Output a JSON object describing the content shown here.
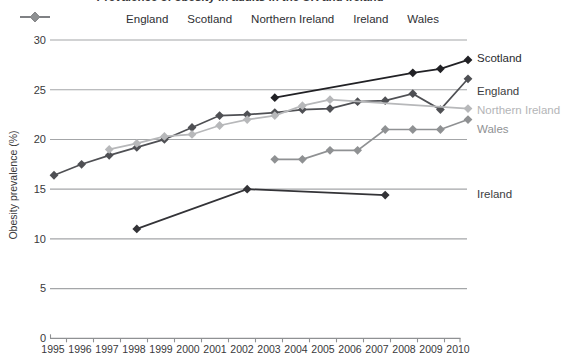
{
  "chart_data": {
    "type": "line",
    "title": "Prevalence of obesity in adults in the UK and Ireland",
    "xlabel": "",
    "ylabel": "Obesity prevalence (%)",
    "ylim": [
      0,
      30
    ],
    "yticks": [
      0,
      5,
      10,
      15,
      20,
      25,
      30
    ],
    "x_categories": [
      1995,
      1996,
      1997,
      1998,
      1999,
      2000,
      2001,
      2002,
      2003,
      2004,
      2005,
      2006,
      2007,
      2008,
      2009,
      2010
    ],
    "grid": "horizontal-only",
    "legend_position": "top",
    "legend_entries": [
      "England",
      "Scotland",
      "Northern Ireland",
      "Ireland",
      "Wales"
    ],
    "series": [
      {
        "name": "England",
        "color": "#4f5054",
        "label_color": "#3c3d41",
        "end_label_value": 24.9,
        "points": [
          [
            1995,
            16.4
          ],
          [
            1996,
            17.5
          ],
          [
            1997,
            18.4
          ],
          [
            1998,
            19.2
          ],
          [
            1999,
            20.0
          ],
          [
            2000,
            21.2
          ],
          [
            2001,
            22.4
          ],
          [
            2002,
            22.5
          ],
          [
            2003,
            22.7
          ],
          [
            2004,
            23.0
          ],
          [
            2005,
            23.1
          ],
          [
            2006,
            23.8
          ],
          [
            2007,
            23.9
          ],
          [
            2008,
            24.6
          ],
          [
            2009,
            23.0
          ],
          [
            2010,
            26.1
          ]
        ]
      },
      {
        "name": "Scotland",
        "color": "#212125",
        "label_color": "#2a2b2f",
        "end_label_value": 28.2,
        "points": [
          [
            2003,
            24.2
          ],
          [
            2008,
            26.7
          ],
          [
            2009,
            27.1
          ],
          [
            2010,
            28.0
          ]
        ]
      },
      {
        "name": "Northern Ireland",
        "color": "#b7b8ba",
        "label_color": "#b4b5b7",
        "end_label_value": 23.0,
        "points": [
          [
            1997,
            19.0
          ],
          [
            1998,
            19.6
          ],
          [
            1999,
            20.3
          ],
          [
            2000,
            20.5
          ],
          [
            2001,
            21.4
          ],
          [
            2002,
            22.0
          ],
          [
            2003,
            22.4
          ],
          [
            2004,
            23.4
          ],
          [
            2005,
            24.0
          ],
          [
            2010,
            23.1
          ]
        ]
      },
      {
        "name": "Ireland",
        "color": "#333337",
        "label_color": "#3c3d41",
        "end_label_value": 14.5,
        "points": [
          [
            1998,
            11.0
          ],
          [
            2002,
            15.0
          ],
          [
            2007,
            14.4
          ]
        ]
      },
      {
        "name": "Wales",
        "color": "#8f9193",
        "label_color": "#8f9193",
        "end_label_value": 21.0,
        "points": [
          [
            2003,
            18.0
          ],
          [
            2004,
            18.0
          ],
          [
            2005,
            18.9
          ],
          [
            2006,
            18.9
          ],
          [
            2007,
            21.0
          ],
          [
            2008,
            21.0
          ],
          [
            2009,
            21.0
          ],
          [
            2010,
            22.0
          ]
        ]
      }
    ]
  }
}
